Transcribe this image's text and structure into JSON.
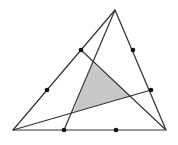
{
  "diagram": {
    "type": "geometry",
    "colors": {
      "background": "#ffffff",
      "stroke": "#333333",
      "point": "#111111",
      "shade": "#c8c8c8"
    },
    "outer_triangle": {
      "A": [
        115,
        10
      ],
      "B": [
        13,
        130
      ],
      "C": [
        166,
        130
      ]
    },
    "trisection_points": [
      {
        "name": "AB-1",
        "xy": [
          81,
          50
        ]
      },
      {
        "name": "AB-2",
        "xy": [
          47,
          90
        ]
      },
      {
        "name": "AC-1",
        "xy": [
          133,
          50
        ]
      },
      {
        "name": "AC-2",
        "xy": [
          151,
          90
        ]
      },
      {
        "name": "BC-1",
        "xy": [
          64,
          130
        ]
      },
      {
        "name": "BC-2",
        "xy": [
          116,
          130
        ]
      }
    ],
    "cevians": [
      {
        "from": [
          115,
          10
        ],
        "to": [
          64,
          130
        ]
      },
      {
        "from": [
          13,
          130
        ],
        "to": [
          151,
          90
        ]
      },
      {
        "from": [
          166,
          130
        ],
        "to": [
          81,
          50
        ]
      }
    ],
    "shaded_triangle": [
      [
        93,
        63
      ],
      [
        130,
        96
      ],
      [
        73,
        112
      ]
    ]
  }
}
